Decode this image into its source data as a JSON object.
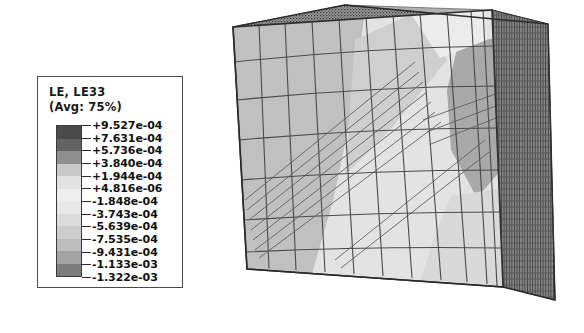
{
  "canvas": {
    "background": "#ffffff",
    "width": 584,
    "height": 333
  },
  "legend": {
    "title_lines": [
      "LE, LE33",
      "(Avg: 75%)"
    ],
    "field_name": "LE, LE33",
    "averaging": "(Avg: 75%)",
    "border_color": "#4a4a4a",
    "values": [
      "+9.527e-04",
      "+7.631e-04",
      "+5.736e-04",
      "+3.840e-04",
      "+1.944e-04",
      "+4.816e-06",
      "-1.848e-04",
      "-3.743e-04",
      "-5.639e-04",
      "-7.535e-04",
      "-9.431e-04",
      "-1.133e-03",
      "-1.322e-03"
    ],
    "band_colors": [
      "#4a4a4a",
      "#636363",
      "#8f8f8f",
      "#c9c9c9",
      "#e2e2e2",
      "#ededed",
      "#e8e8e8",
      "#dcdcdc",
      "#cdcdcd",
      "#bdbdbd",
      "#a3a3a3",
      "#7d7d7d"
    ]
  },
  "chart_data": {
    "type": "heatmap",
    "title": "LE, LE33",
    "subtitle": "(Avg: 75%)",
    "variable": "LE33",
    "averaging_threshold_percent": 75,
    "geometry": "meshed cube (finite element model)",
    "contour_levels": [
      0.0009527,
      0.0007631,
      0.0005736,
      0.000384,
      0.0001944,
      4.816e-06,
      -0.0001848,
      -0.0003743,
      -0.0005639,
      -0.0007535,
      -0.0009431,
      -0.001133,
      -0.001322
    ],
    "contour_level_labels": [
      "+9.527e-04",
      "+7.631e-04",
      "+5.736e-04",
      "+3.840e-04",
      "+1.944e-04",
      "+4.816e-06",
      "-1.848e-04",
      "-3.743e-04",
      "-5.639e-04",
      "-7.535e-04",
      "-9.431e-04",
      "-1.133e-03",
      "-1.322e-03"
    ],
    "value_range": [
      -0.001322,
      0.0009527
    ],
    "max_value": 0.0009527,
    "min_value": -0.001322,
    "band_count": 12,
    "colormap": "grayscale",
    "legend_position": "left",
    "grid": false,
    "regions": [
      {
        "name": "front-face-background",
        "level_label": "-3.743e-04",
        "shade": "#c2c2c2"
      },
      {
        "name": "front-face-light-band",
        "level_label": "+1.944e-04",
        "shade": "#e6e6e6"
      },
      {
        "name": "front-face-mid-diagonal",
        "level_label": "-1.848e-04",
        "shade": "#d2d2d2"
      },
      {
        "name": "right-lobe-dark",
        "level_label": "-7.535e-04",
        "shade": "#a8a8a8"
      },
      {
        "name": "top-face",
        "level_label": "-1.848e-04",
        "shade": "#d8d8d8"
      },
      {
        "name": "side-face-dark",
        "level_label": "-1.133e-03",
        "shade": "#6f6f6f"
      }
    ]
  },
  "model": {
    "name": "cube-mesh",
    "edge_color": "#3c3c3c",
    "faces": {
      "top": "#cfcfcf",
      "front": "#c6c6c6",
      "right": "#8a8a8a"
    }
  }
}
